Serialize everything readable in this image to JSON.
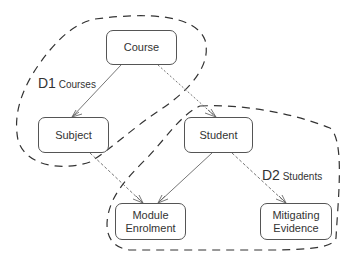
{
  "diagram": {
    "type": "entity-relationship with domain groupings",
    "entities": [
      {
        "id": "course",
        "label": "Course"
      },
      {
        "id": "subject",
        "label": "Subject"
      },
      {
        "id": "student",
        "label": "Student"
      },
      {
        "id": "module_enrolment",
        "label": "Module\nEnrolment"
      },
      {
        "id": "mitigating_evidence",
        "label": "Mitigating\nEvidence"
      }
    ],
    "relationships": [
      {
        "from": "course",
        "to": "subject",
        "kind": "one-to-many"
      },
      {
        "from": "course",
        "to": "student",
        "kind": "one-to-many"
      },
      {
        "from": "subject",
        "to": "module_enrolment",
        "kind": "one-to-many"
      },
      {
        "from": "student",
        "to": "module_enrolment",
        "kind": "one-to-many"
      },
      {
        "from": "student",
        "to": "mitigating_evidence",
        "kind": "one-to-many"
      }
    ],
    "domains": [
      {
        "code": "D1",
        "name": "Courses"
      },
      {
        "code": "D2",
        "name": "Students"
      }
    ]
  },
  "colors": {
    "line": "#555555",
    "boundary": "#333333"
  }
}
